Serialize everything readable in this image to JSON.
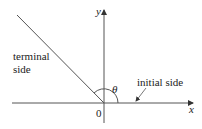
{
  "diagram": {
    "axes": {
      "x_label": "x",
      "y_label": "y",
      "origin_label": "0"
    },
    "angle_label": "θ",
    "terminal_label_line1": "terminal",
    "terminal_label_line2": "side",
    "initial_label": "initial side",
    "colors": {
      "line": "#555555",
      "text": "#222222"
    }
  }
}
